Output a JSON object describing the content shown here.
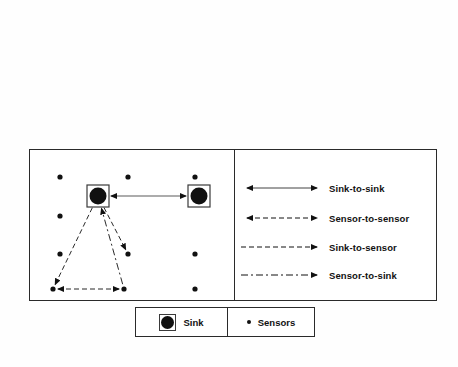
{
  "figure": {
    "type": "network-topology-diagram",
    "background_color": "#ffffff",
    "ink_color": "#111111",
    "frame_color": "#2a2a2a"
  },
  "network_panel": {
    "name": "sensor-network-topology",
    "width": 205,
    "height": 152,
    "sinks": [
      {
        "id": "sink-left",
        "x": 69,
        "y": 47,
        "label": "Sink"
      },
      {
        "id": "sink-right",
        "x": 170,
        "y": 47,
        "label": "Sink"
      }
    ],
    "sensors": [
      {
        "id": "sensor-1",
        "x": 31,
        "y": 28
      },
      {
        "id": "sensor-2",
        "x": 99,
        "y": 28
      },
      {
        "id": "sensor-3",
        "x": 166,
        "y": 28
      },
      {
        "id": "sensor-4",
        "x": 31,
        "y": 67
      },
      {
        "id": "sensor-5",
        "x": 31,
        "y": 105
      },
      {
        "id": "sensor-6",
        "x": 99,
        "y": 105
      },
      {
        "id": "sensor-7",
        "x": 166,
        "y": 105
      },
      {
        "id": "sensor-8",
        "x": 24,
        "y": 140
      },
      {
        "id": "sensor-9",
        "x": 95,
        "y": 140
      },
      {
        "id": "sensor-10",
        "x": 166,
        "y": 140
      }
    ],
    "links": [
      {
        "id": "link-sink-to-sink",
        "kind": "Sink-to-sink",
        "from": "sink-left",
        "to": "sink-right",
        "style": "solid-thin",
        "arrows": "both"
      },
      {
        "id": "link-sink-to-sensor-a",
        "kind": "Sink-to-sensor",
        "from": "sink-left",
        "to": "sensor-8",
        "style": "dashed",
        "arrows": "end"
      },
      {
        "id": "link-sink-to-sensor-b",
        "kind": "Sink-to-sensor",
        "from": "sink-left",
        "to": "sensor-6",
        "style": "dashed",
        "arrows": "end"
      },
      {
        "id": "link-sensor-to-sensor",
        "kind": "Sensor-to-sensor",
        "from": "sensor-8",
        "to": "sensor-9",
        "style": "dashed",
        "arrows": "both"
      },
      {
        "id": "link-sensor-to-sink",
        "kind": "Sensor-to-sink",
        "from": "sensor-9",
        "to": "sink-left",
        "style": "dash-dot",
        "arrows": "end"
      }
    ]
  },
  "line_legend": {
    "name": "link-type-legend",
    "rows": [
      {
        "label": "Sink-to-sink",
        "style": "solid-thin",
        "arrows": "both"
      },
      {
        "label": "Sensor-to-sensor",
        "style": "dashed",
        "arrows": "both"
      },
      {
        "label": "Sink-to-sensor",
        "style": "dashed",
        "arrows": "end"
      },
      {
        "label": "Sensor-to-sink",
        "style": "dash-dot",
        "arrows": "end"
      }
    ]
  },
  "symbol_legend": {
    "name": "symbol-legend",
    "sink_label": "Sink",
    "sensors_label": "Sensors"
  }
}
